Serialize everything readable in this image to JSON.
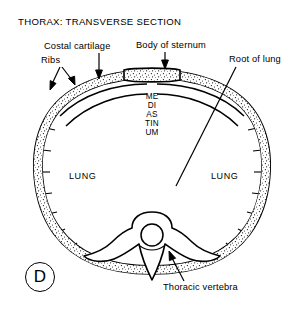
{
  "figure": {
    "title": "THORAX: TRANSVERSE SECTION",
    "panel_letter": "D",
    "background_color": "#ffffff",
    "ink_color": "#000000",
    "labels": {
      "costal_cartilage": "Costal cartilage",
      "ribs": "Ribs",
      "body_of_sternum": "Body of sternum",
      "root_of_lung": "Root of lung",
      "thoracic_vertebra": "Thoracic vertebra",
      "mediastinum": "MEDIASTINUM",
      "lung_left": "LUNG",
      "lung_right": "LUNG"
    }
  }
}
